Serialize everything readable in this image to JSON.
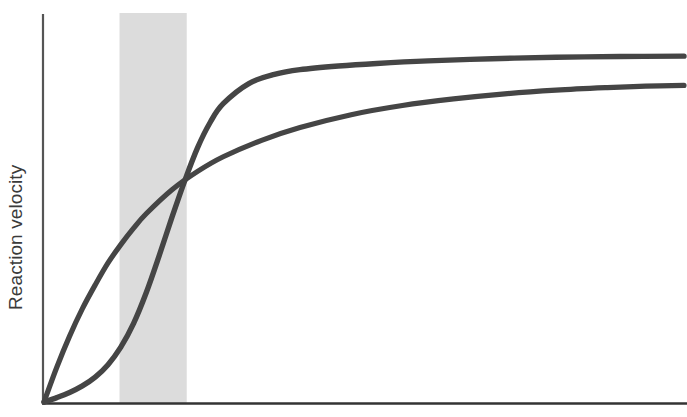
{
  "chart_data": {
    "type": "line",
    "title": "",
    "subtitle": "",
    "xlabel": "",
    "ylabel": "Reaction velocity",
    "xlim": [
      0,
      100
    ],
    "ylim": [
      0,
      100
    ],
    "grid": false,
    "legend": "none",
    "x_axis_ticks": [],
    "y_axis_ticks": [],
    "annotations": [
      {
        "name": "shaded-band",
        "type": "vertical-band",
        "x_start": 11.8,
        "x_end": 22.3,
        "color": "#dcdcdc",
        "label": ""
      }
    ],
    "series": [
      {
        "name": "sigmoidal",
        "color": "#454545",
        "line_width": 4,
        "shape": "sigmoid",
        "plateau": 94.5,
        "x": [
          0,
          2,
          4,
          6,
          8,
          10,
          12,
          14,
          16,
          18,
          20,
          22,
          24,
          26,
          28,
          32,
          36,
          40,
          46,
          52,
          60,
          70,
          80,
          90,
          100
        ],
        "y": [
          0,
          1.2,
          2.6,
          4.4,
          6.8,
          10.2,
          15.0,
          21.5,
          30.0,
          40.0,
          50.5,
          60.5,
          69.5,
          76.5,
          81.5,
          87.0,
          89.5,
          90.8,
          91.8,
          92.5,
          93.2,
          93.8,
          94.2,
          94.4,
          94.5
        ]
      },
      {
        "name": "hyperbolic",
        "color": "#454545",
        "line_width": 4,
        "shape": "hyperbolic",
        "plateau": 86.5,
        "x": [
          0,
          2,
          4,
          6,
          8,
          10,
          12,
          14,
          16,
          20,
          24,
          28,
          34,
          40,
          48,
          56,
          64,
          72,
          80,
          88,
          94,
          100
        ],
        "y": [
          0,
          9.5,
          18.0,
          25.5,
          32.0,
          38.0,
          43.0,
          47.5,
          51.5,
          58.0,
          63.0,
          67.0,
          71.5,
          75.0,
          78.5,
          81.0,
          82.8,
          84.2,
          85.2,
          85.9,
          86.3,
          86.5
        ]
      }
    ]
  },
  "axes": {
    "y_axis_line_color": "#555555",
    "x_axis_line_color": "#333333",
    "y_axis_label": "Reaction velocity"
  },
  "colors": {
    "curve": "#454545",
    "band": "#dcdcdc",
    "background": "#ffffff",
    "label_text": "#3a3a3a"
  }
}
